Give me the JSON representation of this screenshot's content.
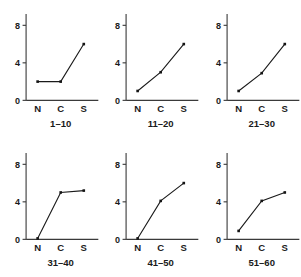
{
  "figure": {
    "background_color": "#ffffff",
    "ink_color": "#1a1a1a",
    "axis_color": "#3a3a3a",
    "layout": "2 rows x 3 columns small multiples"
  },
  "chart_data": [
    {
      "type": "line",
      "title": "1–10",
      "categories": [
        "N",
        "C",
        "S"
      ],
      "values": [
        2.0,
        2.0,
        6.0
      ],
      "xlabel": "",
      "ylabel": "",
      "ylim": [
        0,
        9.2
      ],
      "yticks": [
        0,
        4,
        8
      ],
      "ytick_labels": [
        "0",
        "4",
        "8"
      ],
      "grid": false,
      "legend": false,
      "markers": "square"
    },
    {
      "type": "line",
      "title": "11–20",
      "categories": [
        "N",
        "C",
        "S"
      ],
      "values": [
        1.0,
        3.0,
        6.0
      ],
      "xlabel": "",
      "ylabel": "",
      "ylim": [
        0,
        9.2
      ],
      "yticks": [
        0,
        4,
        8
      ],
      "ytick_labels": [
        "0",
        "4",
        "8"
      ],
      "grid": false,
      "legend": false,
      "markers": "square"
    },
    {
      "type": "line",
      "title": "21–30",
      "categories": [
        "N",
        "C",
        "S"
      ],
      "values": [
        1.0,
        2.9,
        6.0
      ],
      "xlabel": "",
      "ylabel": "",
      "ylim": [
        0,
        9.2
      ],
      "yticks": [
        0,
        4,
        8
      ],
      "ytick_labels": [
        "0",
        "4",
        "8"
      ],
      "grid": false,
      "legend": false,
      "markers": "square"
    },
    {
      "type": "line",
      "title": "31–40",
      "categories": [
        "N",
        "C",
        "S"
      ],
      "values": [
        0.1,
        5.0,
        5.2
      ],
      "xlabel": "",
      "ylabel": "",
      "ylim": [
        0,
        9.2
      ],
      "yticks": [
        0,
        4,
        8
      ],
      "ytick_labels": [
        "0",
        "4",
        "8"
      ],
      "grid": false,
      "legend": false,
      "markers": "square"
    },
    {
      "type": "line",
      "title": "41–50",
      "categories": [
        "N",
        "C",
        "S"
      ],
      "values": [
        0.1,
        4.1,
        6.0
      ],
      "xlabel": "",
      "ylabel": "",
      "ylim": [
        0,
        9.2
      ],
      "yticks": [
        0,
        4,
        8
      ],
      "ytick_labels": [
        "0",
        "4",
        "8"
      ],
      "grid": false,
      "legend": false,
      "markers": "square"
    },
    {
      "type": "line",
      "title": "51–60",
      "categories": [
        "N",
        "C",
        "S"
      ],
      "values": [
        0.9,
        4.1,
        5.0
      ],
      "xlabel": "",
      "ylabel": "",
      "ylim": [
        0,
        9.2
      ],
      "yticks": [
        0,
        4,
        8
      ],
      "ytick_labels": [
        "0",
        "4",
        "8"
      ],
      "grid": false,
      "legend": false,
      "markers": "square"
    }
  ]
}
